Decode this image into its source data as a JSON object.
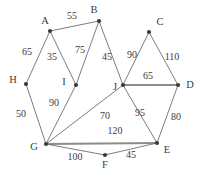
{
  "figure": {
    "kind": "weighted-undirected-graph",
    "width": 207,
    "height": 178,
    "background": "#ffffff",
    "edge_color": "#6e6e6e",
    "node_color": "#3a3a3a",
    "label_color": "#3c3c3c"
  },
  "nodes": [
    {
      "id": "A",
      "label": "A",
      "x": 50,
      "y": 31,
      "label_x": 45,
      "label_y": 21
    },
    {
      "id": "B",
      "label": "B",
      "x": 99,
      "y": 21,
      "label_x": 94,
      "label_y": 10
    },
    {
      "id": "C",
      "label": "C",
      "x": 149,
      "y": 32,
      "label_x": 160,
      "label_y": 22
    },
    {
      "id": "D",
      "label": "D",
      "x": 178,
      "y": 85,
      "label_x": 190,
      "label_y": 85
    },
    {
      "id": "E",
      "label": "E",
      "x": 157,
      "y": 143,
      "label_x": 167,
      "label_y": 150
    },
    {
      "id": "F",
      "label": "F",
      "x": 105,
      "y": 155,
      "label_x": 105,
      "label_y": 165
    },
    {
      "id": "G",
      "label": "G",
      "x": 46,
      "y": 144,
      "label_x": 34,
      "label_y": 147
    },
    {
      "id": "H",
      "label": "H",
      "x": 26,
      "y": 84,
      "label_x": 13,
      "label_y": 80
    },
    {
      "id": "I",
      "label": "I",
      "x": 76,
      "y": 85,
      "label_x": 64,
      "label_y": 82
    },
    {
      "id": "J",
      "label": "J",
      "x": 123,
      "y": 85,
      "label_x": 115,
      "label_y": 87
    }
  ],
  "edges": [
    {
      "from": "A",
      "to": "B",
      "weight": "55",
      "label_x": 72,
      "label_y": 16,
      "thick": false
    },
    {
      "from": "A",
      "to": "H",
      "weight": "65",
      "label_x": 27,
      "label_y": 52,
      "thick": false
    },
    {
      "from": "A",
      "to": "I",
      "weight": "35",
      "label_x": 52,
      "label_y": 57,
      "thick": false
    },
    {
      "from": "B",
      "to": "I",
      "weight": "75",
      "label_x": 80,
      "label_y": 50,
      "thick": false
    },
    {
      "from": "B",
      "to": "J",
      "weight": "45",
      "label_x": 107,
      "label_y": 57,
      "thick": false
    },
    {
      "from": "C",
      "to": "J",
      "weight": "90",
      "label_x": 132,
      "label_y": 55,
      "thick": false
    },
    {
      "from": "C",
      "to": "D",
      "weight": "110",
      "label_x": 172,
      "label_y": 57,
      "thick": false
    },
    {
      "from": "J",
      "to": "D",
      "weight": "65",
      "label_x": 148,
      "label_y": 76,
      "thick": true
    },
    {
      "from": "J",
      "to": "E",
      "weight": "95",
      "label_x": 140,
      "label_y": 113,
      "thick": false
    },
    {
      "from": "D",
      "to": "E",
      "weight": "80",
      "label_x": 176,
      "label_y": 117,
      "thick": false
    },
    {
      "from": "H",
      "to": "G",
      "weight": "50",
      "label_x": 21,
      "label_y": 114,
      "thick": false
    },
    {
      "from": "I",
      "to": "G",
      "weight": "90",
      "label_x": 54,
      "label_y": 103,
      "thick": false
    },
    {
      "from": "G",
      "to": "J",
      "weight": "70",
      "label_x": 105,
      "label_y": 116,
      "thick": false
    },
    {
      "from": "G",
      "to": "E",
      "weight": "120",
      "label_x": 115,
      "label_y": 131,
      "thick": true
    },
    {
      "from": "G",
      "to": "F",
      "weight": "100",
      "label_x": 75,
      "label_y": 157,
      "thick": false
    },
    {
      "from": "F",
      "to": "E",
      "weight": "45",
      "label_x": 131,
      "label_y": 155,
      "thick": false
    }
  ]
}
